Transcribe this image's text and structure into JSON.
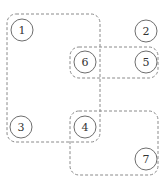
{
  "diagram": {
    "stroke_color": "#808080",
    "text_color": "#333333",
    "nodes": [
      {
        "id": "1",
        "label": "1",
        "cx": 22,
        "cy": 30
      },
      {
        "id": "2",
        "label": "2",
        "cx": 146,
        "cy": 31
      },
      {
        "id": "6",
        "label": "6",
        "cx": 85,
        "cy": 62
      },
      {
        "id": "5",
        "label": "5",
        "cx": 146,
        "cy": 62
      },
      {
        "id": "3",
        "label": "3",
        "cx": 21,
        "cy": 127
      },
      {
        "id": "4",
        "label": "4",
        "cx": 85,
        "cy": 127
      },
      {
        "id": "7",
        "label": "7",
        "cx": 146,
        "cy": 159
      }
    ],
    "groups": [
      {
        "name": "group-1-3-4-6",
        "members": [
          "1",
          "3",
          "4",
          "6"
        ],
        "x": 7,
        "y": 14,
        "w": 93,
        "h": 128
      },
      {
        "name": "group-6-5",
        "members": [
          "6",
          "5"
        ],
        "x": 70,
        "y": 47,
        "w": 88,
        "h": 31
      },
      {
        "name": "group-4-7",
        "members": [
          "4",
          "7"
        ],
        "x": 70,
        "y": 111,
        "w": 88,
        "h": 64
      }
    ]
  }
}
